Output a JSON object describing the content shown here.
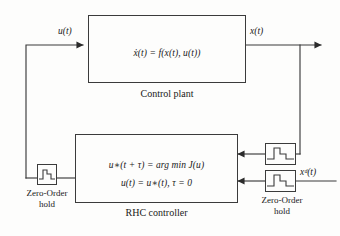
{
  "diagram": {
    "stroke_color": "#3b3b3b",
    "background_color": "#fdfdfc"
  },
  "plant_block": {
    "name": "Control plant",
    "equation": "ẋ(t) = f(x(t), u(t))",
    "caption": "Control plant"
  },
  "controller_block": {
    "name": "RHC controller",
    "equation_line1": "u∗(t + τ) =  arg min J(u)",
    "equation_line2": "u(t) = u∗(t), τ = 0",
    "caption": "RHC controller"
  },
  "signals": {
    "control_input": "u(t)",
    "state_output": "x(t)",
    "desired_state": "xᵈ(t)"
  },
  "zoh_blocks": [
    {
      "id": "zoh-left",
      "label_line1": "Zero-Order",
      "label_line2": "hold",
      "icon": "zero-order-hold-icon"
    },
    {
      "id": "zoh-upper-right",
      "label_line1": "",
      "label_line2": "",
      "icon": "zero-order-hold-icon"
    },
    {
      "id": "zoh-lower-right",
      "label_line1": "Zero-Order",
      "label_line2": "hold",
      "icon": "zero-order-hold-icon"
    }
  ]
}
